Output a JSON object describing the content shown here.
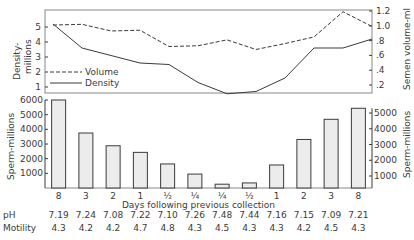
{
  "chart_data": [
    {
      "type": "line",
      "title": "",
      "xlabel": "Days following previous collection",
      "categories": [
        "8",
        "3",
        "2",
        "1",
        "1/2",
        "1/4",
        "1/4",
        "1/2",
        "1",
        "2",
        "3",
        "8"
      ],
      "ylabel": "Density-millions",
      "y2label": "Semen volume-ml",
      "ylim": [
        0.5,
        5.8
      ],
      "y2lim": [
        0.15,
        1.25
      ],
      "yticks": [
        "5",
        "4",
        "3",
        "2",
        "1"
      ],
      "y2ticks": [
        "1.2",
        "1.0",
        ".8",
        ".6",
        ".4",
        ".2"
      ],
      "legend": [
        "Volume",
        "Density"
      ],
      "legend_position": "lower-left",
      "series": [
        {
          "name": "Volume",
          "style": "dashed",
          "axis": "right",
          "values": [
            1.01,
            1.02,
            0.93,
            0.94,
            0.72,
            0.73,
            0.81,
            0.68,
            0.76,
            0.85,
            1.19,
            0.99
          ]
        },
        {
          "name": "Density",
          "style": "solid",
          "axis": "left",
          "values": [
            5.2,
            3.6,
            3.1,
            2.6,
            2.5,
            1.3,
            0.55,
            0.7,
            1.6,
            3.6,
            3.6,
            4.2
          ]
        }
      ]
    },
    {
      "type": "bar",
      "title": "",
      "xlabel": "Days following previous collection",
      "categories": [
        "8",
        "3",
        "2",
        "1",
        "1/2",
        "1/4",
        "1/4",
        "1/2",
        "1",
        "2",
        "3",
        "8"
      ],
      "ylabel": "Sperm-millions",
      "ylim": [
        0,
        6000
      ],
      "yticks": [
        "6000",
        "5000",
        "4000",
        "3000",
        "2000",
        "1000"
      ],
      "y2label": "Sperm-millions",
      "y2ticks": [
        "5000",
        "4000",
        "3000",
        "2000",
        "1000"
      ],
      "values": [
        6000,
        3750,
        2880,
        2430,
        1640,
        950,
        480,
        560,
        1700,
        3320,
        4600,
        5300
      ]
    }
  ],
  "labels": {
    "top_left_axis": "Density-\nmillions",
    "top_right_axis": "Semen volume-ml",
    "bar_left_axis": "Sperm-millions",
    "bar_right_axis": "Sperm-millions",
    "legend_volume": "Volume",
    "legend_density": "Density",
    "x_title": "Days following previous collection"
  },
  "table": {
    "ph_label": "pH",
    "motility_label": "Motility",
    "ph": [
      "7.19",
      "7.24",
      "7.08",
      "7.22",
      "7.10",
      "7.26",
      "7.48",
      "7.44",
      "7.16",
      "7.15",
      "7.09",
      "7.21"
    ],
    "motility": [
      "4.3",
      "4.2",
      "4.2",
      "4.7",
      "4.8",
      "4.3",
      "4.5",
      "4.3",
      "4.3",
      "4.2",
      "4.5",
      "4.3"
    ]
  }
}
